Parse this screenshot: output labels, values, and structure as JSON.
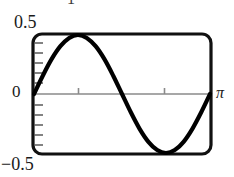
{
  "figure": {
    "top_clipped_label": "−1",
    "y_label_max": "0.5",
    "y_label_zero": "0",
    "y_label_min": "−0.5",
    "x_label_right": "π",
    "colors": {
      "curve": "#000000",
      "frame": "#111111",
      "axis": "#8a8a8a",
      "text": "#1a1a1a",
      "background": "#ffffff"
    }
  },
  "chart_data": {
    "type": "line",
    "title": "",
    "xlabel": "",
    "ylabel": "",
    "xlim": [
      0,
      3.14159
    ],
    "ylim": [
      -0.5,
      0.5
    ],
    "grid": false,
    "legend": null,
    "xticks": [
      1.0472,
      2.0944
    ],
    "xticklabels": [
      "",
      ""
    ],
    "yticks": [
      -0.45,
      -0.36,
      -0.27,
      -0.18,
      -0.09,
      0,
      0.09,
      0.18,
      0.27,
      0.36,
      0.45
    ],
    "yticklabels": [
      "",
      "",
      "",
      "",
      "",
      "0",
      "",
      "",
      "",
      "",
      ""
    ],
    "axis_labels_shown": [
      "0.5",
      "0",
      "-0.5",
      "π"
    ],
    "series": [
      {
        "name": "curve",
        "description": "one full period of a sine-like wave over [0, pi], peak near x=0.80 and trough near x=2.30",
        "x": [
          0.0,
          0.157,
          0.314,
          0.471,
          0.628,
          0.785,
          0.942,
          1.1,
          1.257,
          1.414,
          1.571,
          1.728,
          1.885,
          2.042,
          2.199,
          2.356,
          2.513,
          2.67,
          2.827,
          2.985,
          3.142
        ],
        "y": [
          0.0,
          0.155,
          0.295,
          0.405,
          0.475,
          0.5,
          0.475,
          0.405,
          0.295,
          0.155,
          0.0,
          -0.155,
          -0.295,
          -0.405,
          -0.475,
          -0.5,
          -0.475,
          -0.405,
          -0.295,
          -0.155,
          0.0
        ]
      }
    ]
  }
}
